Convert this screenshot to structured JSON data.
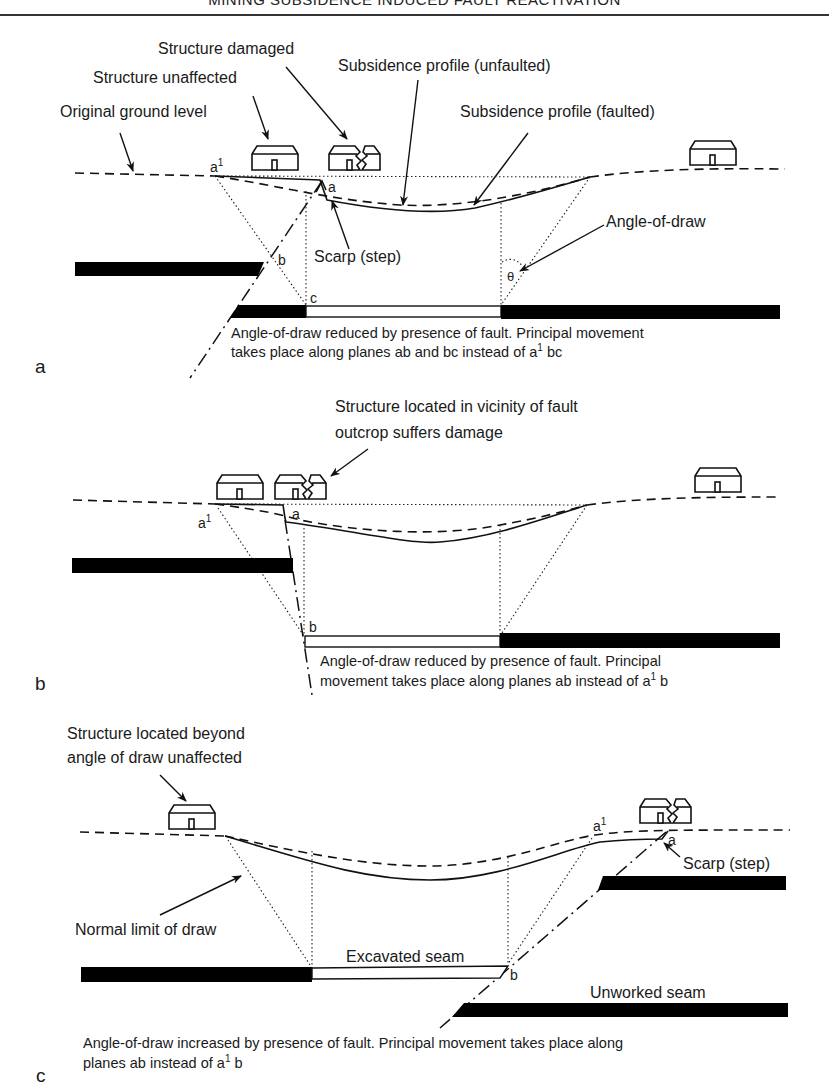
{
  "header": {
    "running_title": "MINING SUBSIDENCE INDUCED FAULT REACTIVATION"
  },
  "panel_a": {
    "panel_label": "a",
    "labels": {
      "structure_damaged": "Structure damaged",
      "structure_unaffected": "Structure unaffected",
      "original_ground_level": "Original ground level",
      "subsidence_unfaulted": "Subsidence profile (unfaulted)",
      "subsidence_faulted": "Subsidence profile (faulted)",
      "angle_of_draw": "Angle-of-draw",
      "scarp": "Scarp (step)",
      "theta": "θ"
    },
    "points": {
      "a1": "a",
      "a1_sup": "1",
      "a": "a",
      "b": "b",
      "c": "c"
    },
    "caption_line1": "Angle-of-draw reduced by presence of fault. Principal movement",
    "caption_line2_pre": "takes place along planes ab and bc instead of a",
    "caption_line2_sup": "1",
    "caption_line2_post": " bc"
  },
  "panel_b": {
    "panel_label": "b",
    "labels": {
      "structure_vicinity_line1": "Structure located in vicinity of fault",
      "structure_vicinity_line2": "outcrop suffers damage"
    },
    "points": {
      "a1": "a",
      "a1_sup": "1",
      "a": "a",
      "b": "b"
    },
    "caption_line1": "Angle-of-draw reduced by presence of fault. Principal",
    "caption_line2_pre": "movement takes place along planes ab instead of a",
    "caption_line2_sup": "1",
    "caption_line2_post": " b"
  },
  "panel_c": {
    "panel_label": "c",
    "labels": {
      "structure_beyond_line1": "Structure located beyond",
      "structure_beyond_line2": "angle of draw unaffected",
      "normal_limit": "Normal limit of draw",
      "excavated_seam": "Excavated seam",
      "unworked_seam": "Unworked seam",
      "scarp": "Scarp (step)"
    },
    "points": {
      "a1": "a",
      "a1_sup": "1",
      "a": "a",
      "b": "b"
    },
    "caption_line1": "Angle-of-draw increased by presence of fault. Principal movement takes place along",
    "caption_line2_pre": "planes ab instead of a",
    "caption_line2_sup": "1",
    "caption_line2_post": " b"
  }
}
